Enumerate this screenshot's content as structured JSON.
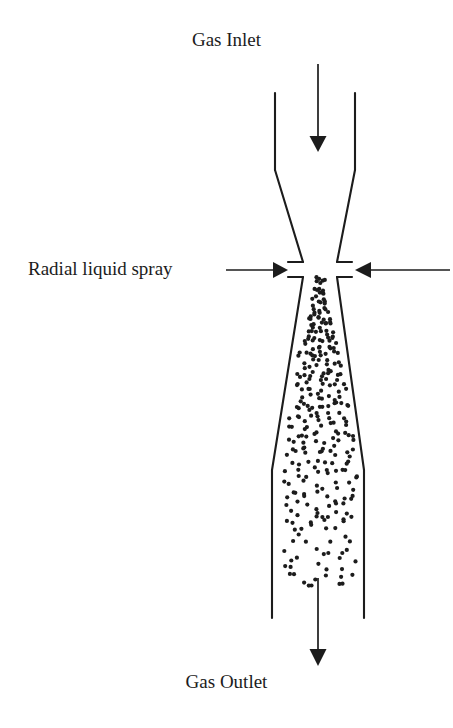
{
  "diagram": {
    "kind": "venturi-scrubber-schematic",
    "title_top": "Gas Inlet",
    "title_bottom": "Gas Outlet",
    "spray_label": "Radial liquid spray",
    "colors": {
      "line": "#1c1c1c",
      "droplet": "#1c1c1c",
      "background": "#ffffff",
      "text": "#1c1c1c"
    },
    "geometry": {
      "inlet_wall_left_x": 275,
      "inlet_wall_right_x": 355,
      "inlet_wall_top_y": 93,
      "convergence_start_y": 170,
      "throat_left_x": 303,
      "throat_right_x": 337,
      "throat_upper_y": 262,
      "throat_lower_y": 277,
      "divergence_end_y": 470,
      "outlet_wall_left_x": 272,
      "outlet_wall_right_x": 364,
      "outlet_wall_bottom_y": 618,
      "stub_outer_left_x": 288,
      "stub_outer_right_x": 352
    },
    "arrows": {
      "inlet": {
        "name": "gas-inlet-arrow",
        "direction": "down",
        "x": 318,
        "y_start": 64,
        "y_end": 150
      },
      "outlet": {
        "name": "gas-outlet-arrow",
        "direction": "down",
        "x": 318,
        "y_start": 578,
        "y_end": 665
      },
      "spray_left": {
        "name": "spray-arrow-left",
        "direction": "right",
        "x_start": 226,
        "x_end": 287,
        "y": 270
      },
      "spray_right": {
        "name": "spray-arrow-right",
        "direction": "left",
        "x_start": 450,
        "x_end": 354,
        "y": 270
      }
    },
    "droplets": {
      "description": "liquid spray droplets dispersed in diverging throat and outlet duct",
      "radius": 2.1,
      "count": 232
    }
  }
}
